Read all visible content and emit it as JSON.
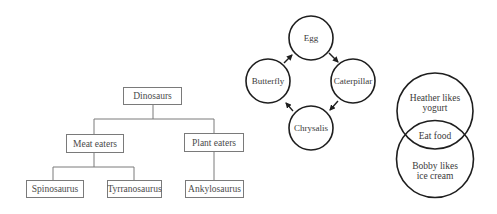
{
  "tree": {
    "root": "Dinosaurs",
    "groups": [
      {
        "label": "Meat eaters",
        "children": [
          "Spinosaurus",
          "Tyrranosaurus"
        ]
      },
      {
        "label": "Plant eaters",
        "children": [
          "Ankylosaurus"
        ]
      }
    ]
  },
  "cycle": {
    "stages": [
      "Egg",
      "Caterpillar",
      "Chrysalis",
      "Butterfly"
    ]
  },
  "venn": {
    "top_line1": "Heather likes",
    "top_line2": "yogurt",
    "overlap": "Eat food",
    "bottom_line1": "Bobby likes",
    "bottom_line2": "ice cream"
  },
  "colors": {
    "tree_line": "#7a7a7a",
    "circle_stroke": "#1e1e1e",
    "text": "#3a3a3a",
    "background": "#ffffff"
  }
}
